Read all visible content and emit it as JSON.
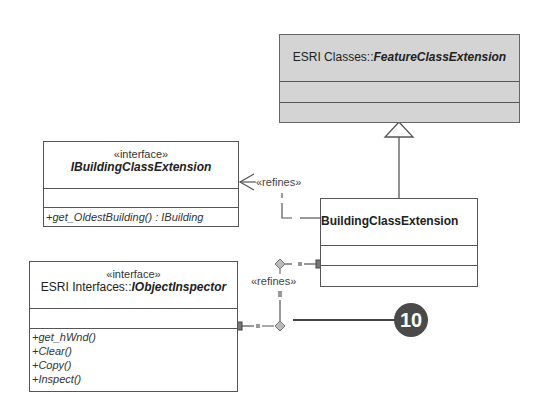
{
  "feature_class": {
    "namespace": "ESRI Classes::",
    "name": "FeatureClassExtension"
  },
  "ibuilding": {
    "stereotype": "«interface»",
    "name": "IBuildingClassExtension",
    "operations": [
      "+get_OldestBuilding() : IBuilding"
    ]
  },
  "building": {
    "name": "BuildingClassExtension"
  },
  "iobject": {
    "stereotype": "«interface»",
    "namespace": "ESRI Interfaces::",
    "name": "IObjectInspector",
    "operations": [
      "+get_hWnd()",
      "+Clear()",
      "+Copy()",
      "+Inspect()"
    ]
  },
  "relations": {
    "refines_top": "«refines»",
    "refines_bottom": "«refines»"
  },
  "callout": {
    "number": "10"
  }
}
